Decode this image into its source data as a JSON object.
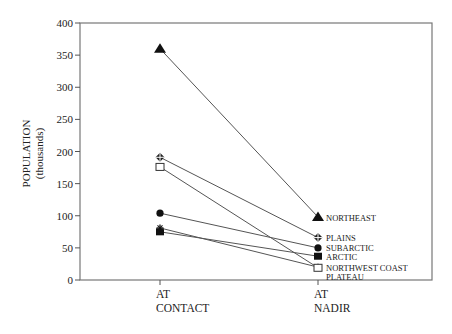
{
  "chart_data": {
    "type": "line",
    "title": "",
    "xlabel": "",
    "ylabel": "POPULATION",
    "ylabel_sub": "(thousands)",
    "ylim": [
      0,
      400
    ],
    "yticks": [
      0,
      50,
      100,
      150,
      200,
      250,
      300,
      350,
      400
    ],
    "grid": false,
    "categories": [
      {
        "line1": "AT",
        "line2": "CONTACT"
      },
      {
        "line1": "AT",
        "line2": "NADIR"
      }
    ],
    "series": [
      {
        "name": "NORTHEAST",
        "marker": "triangle-filled",
        "values": [
          360,
          98
        ]
      },
      {
        "name": "PLAINS",
        "marker": "cross-diamond",
        "values": [
          191,
          66
        ]
      },
      {
        "name": "SUBARCTIC",
        "marker": "circle-filled",
        "values": [
          104,
          50
        ]
      },
      {
        "name": "ARCTIC",
        "marker": "square-filled",
        "values": [
          75,
          37
        ]
      },
      {
        "name": "NORTHWEST COAST",
        "marker": "star",
        "values": [
          81,
          20
        ]
      },
      {
        "name": "PLATEAU",
        "marker": "square-open",
        "values": [
          176,
          19
        ]
      }
    ]
  }
}
